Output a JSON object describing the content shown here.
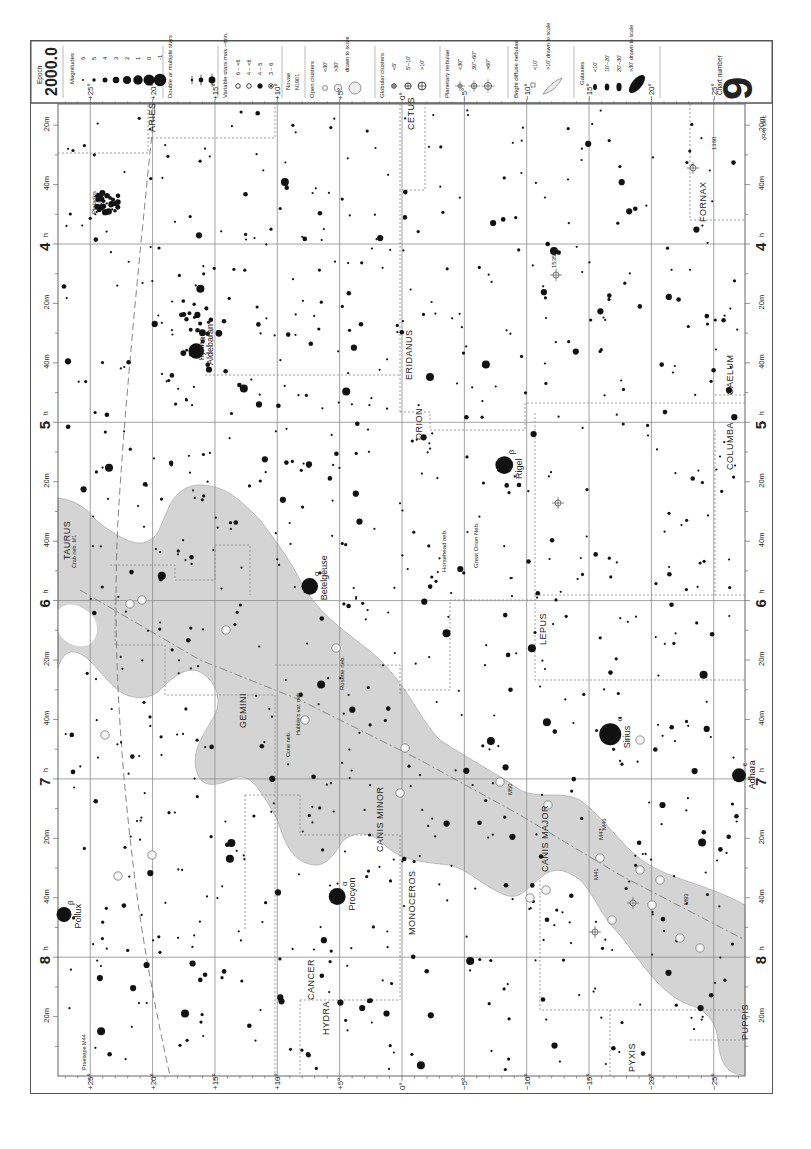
{
  "chart_data": {
    "type": "scatter",
    "subtitle": "Epoch 2000.0",
    "orientation": "rotated 90deg counter-clockwise; right ascension increases downward, declination decreases rightward",
    "xlabel": "Declination",
    "ylabel": "Right ascension",
    "ra_range_h": [
      3.333,
      8.667
    ],
    "dec_range_deg": [
      27.5,
      -27.5
    ],
    "grid": true,
    "ra_major_ticks": [
      "4h",
      "5h",
      "6h",
      "7h",
      "8h"
    ],
    "ra_minor_ticks": [
      "20m",
      "40m"
    ],
    "dec_ticks": [
      "+25°",
      "+20°",
      "+15°",
      "+10°",
      "+5°",
      "0°",
      "−5°",
      "−10°",
      "−15°",
      "−20°",
      "−25°"
    ],
    "legend": {
      "epoch_label": "Epoch",
      "epoch_value": "2000.0",
      "magnitudes_label": "Magnitudes",
      "magnitudes": [
        "6",
        "5",
        "4",
        "3",
        "2",
        "1",
        "0",
        "-1"
      ],
      "double_label": "Double or multiple stars",
      "variable_label": "Variable stars max.–min.",
      "variable_ranges": [
        "6 – <6",
        "4 – <6",
        "4 – 5",
        "3 – 6"
      ],
      "novae_label": "Novae",
      "novae_example": "N1901",
      "open_clusters_label": "Open clusters",
      "open_clusters": [
        "<30'",
        ">30'",
        "drawn to scale"
      ],
      "globular_label": "Globular clusters",
      "globular": [
        "<5'",
        "5'–10'",
        ">10'"
      ],
      "planetary_label": "Planetary nebulae",
      "planetary": [
        "<30\"",
        "30\"–60\"",
        ">60\""
      ],
      "diffuse_label": "Bright diffuse nebulae",
      "diffuse": [
        "<10'",
        ">10' drawn to scale"
      ],
      "galaxies_label": "Galaxies",
      "galaxies": [
        "<10'",
        "10'–20'",
        "20'–30'",
        ">30' drawn to scale"
      ],
      "chart_number_label": "Chart number",
      "chart_number": "9"
    },
    "constellations": [
      "ARIES",
      "TAURUS",
      "CETUS",
      "ERIDANUS",
      "ORION",
      "FORNAX",
      "CAELUM",
      "COLUMBA",
      "LEPUS",
      "GEMINI",
      "CANIS MINOR",
      "MONOCEROS",
      "CANIS MAJOR",
      "CANCER",
      "HYDRA",
      "PYXIS",
      "PUPPIS"
    ],
    "named_stars": [
      {
        "name": "Aldebaran",
        "bayer": "α",
        "ra": 4.6,
        "dec": 16.5,
        "mag": 0.9
      },
      {
        "name": "Rigel",
        "bayer": "β",
        "ra": 5.24,
        "dec": -8.2,
        "mag": 0.1
      },
      {
        "name": "Betelgeuse",
        "bayer": "α",
        "ra": 5.92,
        "dec": 7.4,
        "mag": 0.5
      },
      {
        "name": "Sirius",
        "bayer": "α",
        "ra": 6.75,
        "dec": -16.7,
        "mag": -1.5
      },
      {
        "name": "Adhara",
        "bayer": "ε",
        "ra": 6.98,
        "dec": -28.9,
        "mag": 1.5
      },
      {
        "name": "Procyon",
        "bayer": "α",
        "ra": 7.66,
        "dec": 5.2,
        "mag": 0.4
      },
      {
        "name": "Pollux",
        "bayer": "β",
        "ra": 7.76,
        "dec": 28.0,
        "mag": 1.1
      }
    ],
    "labelled_objects": [
      "Pleiades M45",
      "Hyades",
      "Great Orion Nebula M42",
      "Horsehead nebula",
      "Crab nebula M1",
      "Rosette nebula",
      "Cone nebula",
      "Hubble's variable nebula",
      "Praesepe M44",
      "M41",
      "M46",
      "M47",
      "M50",
      "M93",
      "NGC 1535",
      "NGC 1360"
    ],
    "annotations": [
      "Ecliptic (dashed line)",
      "Milky Way (shaded band)",
      "Galactic equator (dash-dot line)",
      "Constellation boundaries (dotted lines)"
    ]
  }
}
